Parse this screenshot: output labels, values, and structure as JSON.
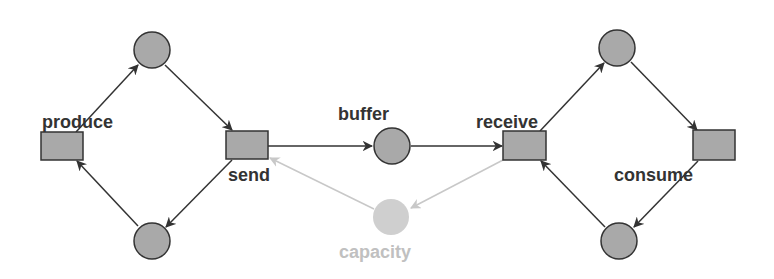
{
  "diagram": {
    "type": "petri-net",
    "colors": {
      "node_fill": "#a9a9a9",
      "node_stroke": "#333333",
      "arc": "#333333",
      "label": "#333333",
      "faded": "#c8c8c8",
      "faded_label": "#c0c0c0"
    },
    "transitions": [
      {
        "id": "produce",
        "label": "produce"
      },
      {
        "id": "send",
        "label": "send"
      },
      {
        "id": "receive",
        "label": "receive"
      },
      {
        "id": "consume",
        "label": "consume"
      }
    ],
    "places": [
      {
        "id": "p_producer_ready",
        "label": ""
      },
      {
        "id": "p_producer_idle",
        "label": ""
      },
      {
        "id": "buffer",
        "label": "buffer"
      },
      {
        "id": "capacity",
        "label": "capacity",
        "faded": true
      },
      {
        "id": "p_consumer_ready",
        "label": ""
      },
      {
        "id": "p_consumer_idle",
        "label": ""
      }
    ],
    "arcs": [
      {
        "from": "produce",
        "to": "p_producer_ready"
      },
      {
        "from": "p_producer_ready",
        "to": "send"
      },
      {
        "from": "send",
        "to": "p_producer_idle"
      },
      {
        "from": "p_producer_idle",
        "to": "produce"
      },
      {
        "from": "send",
        "to": "buffer"
      },
      {
        "from": "buffer",
        "to": "receive"
      },
      {
        "from": "receive",
        "to": "capacity",
        "faded": true
      },
      {
        "from": "capacity",
        "to": "send",
        "faded": true
      },
      {
        "from": "receive",
        "to": "p_consumer_ready"
      },
      {
        "from": "p_consumer_ready",
        "to": "consume"
      },
      {
        "from": "consume",
        "to": "p_consumer_idle"
      },
      {
        "from": "p_consumer_idle",
        "to": "receive"
      }
    ]
  }
}
